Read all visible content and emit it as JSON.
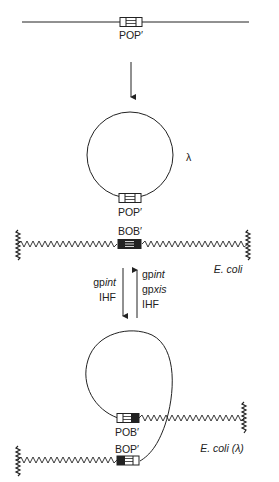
{
  "diagram": {
    "phage_linear": {
      "site_label": "POP′"
    },
    "phage_circular": {
      "site_label": "POP′",
      "phage_symbol": "λ"
    },
    "bacterial_chromosome": {
      "site_label": "BOB′",
      "organism_label": "E. coli"
    },
    "integration_arrow": {
      "direction": "down",
      "factors": [
        "gpint",
        "IHF"
      ]
    },
    "excision_arrow": {
      "direction": "up",
      "factors": [
        "gpint",
        "gpxis",
        "IHF"
      ]
    },
    "lysogen": {
      "site_left_label": "POB′",
      "site_right_label": "BOP′",
      "organism_label": "E. coli (λ)"
    }
  },
  "colors": {
    "ink": "#222222",
    "background": "#ffffff"
  }
}
